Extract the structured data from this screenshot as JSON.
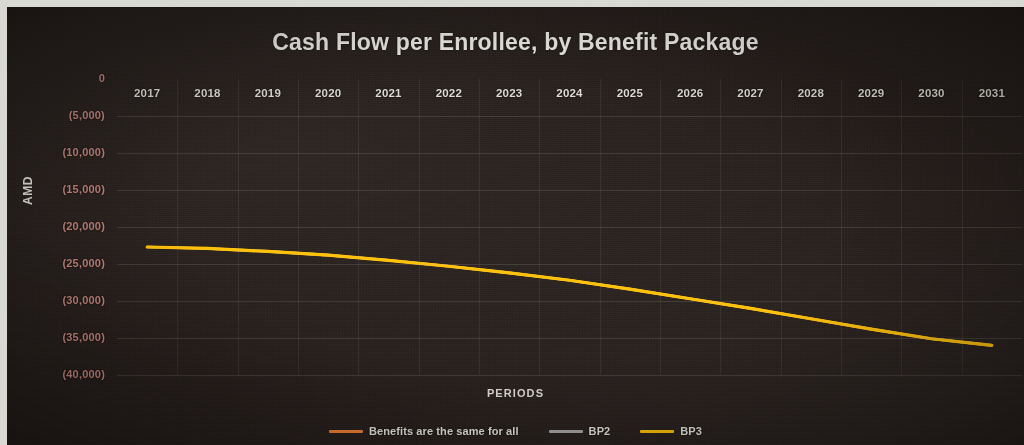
{
  "chart_data": {
    "type": "line",
    "title": "Cash Flow per Enrollee, by Benefit Package",
    "xlabel": "PERIODS",
    "ylabel": "AMD",
    "grid": true,
    "legend_position": "bottom",
    "ylim": [
      -40000,
      0
    ],
    "ytick_labels": [
      "0",
      "(5,000)",
      "(10,000)",
      "(15,000)",
      "(20,000)",
      "(25,000)",
      "(30,000)",
      "(35,000)",
      "(40,000)"
    ],
    "ytick_values": [
      0,
      -5000,
      -10000,
      -15000,
      -20000,
      -25000,
      -30000,
      -35000,
      -40000
    ],
    "categories": [
      "2017",
      "2018",
      "2019",
      "2020",
      "2021",
      "2022",
      "2023",
      "2024",
      "2025",
      "2026",
      "2027",
      "2028",
      "2029",
      "2030",
      "2031"
    ],
    "series": [
      {
        "name": "Benefits are the same for all",
        "color": "#ED7D31",
        "values": [
          -22700,
          -22900,
          -23300,
          -23800,
          -24500,
          -25300,
          -26200,
          -27200,
          -28400,
          -29700,
          -31000,
          -32400,
          -33800,
          -35100,
          -36000
        ]
      },
      {
        "name": "BP2",
        "color": "#A5A5A5",
        "values": [
          -22700,
          -22900,
          -23300,
          -23800,
          -24500,
          -25300,
          -26200,
          -27200,
          -28400,
          -29700,
          -31000,
          -32400,
          -33800,
          -35100,
          -36000
        ]
      },
      {
        "name": "BP3",
        "color": "#FFC000",
        "values": [
          -22700,
          -22900,
          -23300,
          -23800,
          -24500,
          -25300,
          -26200,
          -27200,
          -28400,
          -29700,
          -31000,
          -32400,
          -33800,
          -35100,
          -36000
        ]
      }
    ]
  },
  "theme": {
    "plot_background": "#241c19",
    "title_color": "#f2efe9",
    "ytick_color": "#c4837a",
    "xtick_color": "#dedad2",
    "gridline_color": "#bab4aa"
  }
}
